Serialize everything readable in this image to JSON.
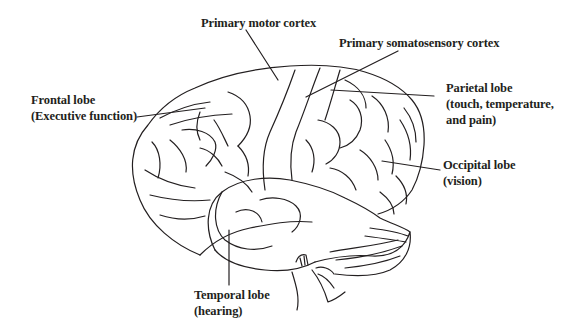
{
  "diagram": {
    "line_color": "#231f20",
    "background": "#ffffff"
  },
  "labels": {
    "primary_motor": {
      "line1": "Primary motor cortex"
    },
    "primary_somatosensory": {
      "line1": "Primary somatosensory cortex"
    },
    "frontal": {
      "line1": "Frontal lobe",
      "line2": "(Executive function)"
    },
    "parietal": {
      "line1": "Parietal lobe",
      "line2": "(touch, temperature,",
      "line3": "and pain)"
    },
    "occipital": {
      "line1": "Occipital lobe",
      "line2": "(vision)"
    },
    "temporal": {
      "line1": "Temporal lobe",
      "line2": "(hearing)"
    }
  }
}
